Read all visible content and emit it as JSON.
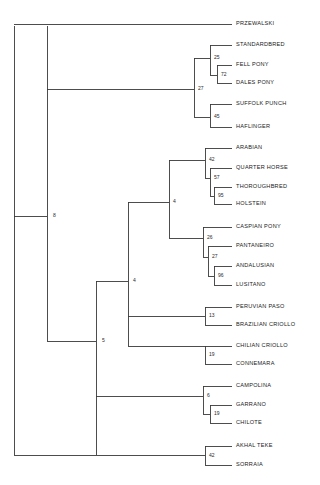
{
  "figure": {
    "name": "horse-breed-phylogenetic-tree",
    "type": "phylogram",
    "background_color": "#ffffff",
    "line_color": "#3a3a3a",
    "text_color": "#1a1a1a"
  },
  "chart_data": {
    "type": "tree",
    "title": "",
    "xlabel": "",
    "ylabel": "",
    "orientation": "left-to-right",
    "leaf_count": 22,
    "internal_node_count": 14,
    "taxa": [
      {
        "id": "t1",
        "label": "PRZEWALSKI",
        "x": 236,
        "y": 24
      },
      {
        "id": "t2",
        "label": "STANDARDBRED",
        "x": 236,
        "y": 45
      },
      {
        "id": "t3",
        "label": "FELL PONY",
        "x": 236,
        "y": 65
      },
      {
        "id": "t4",
        "label": "DALES PONY",
        "x": 236,
        "y": 83
      },
      {
        "id": "t5",
        "label": "SUFFOLK PUNCH",
        "x": 236,
        "y": 104
      },
      {
        "id": "t6",
        "label": "HAFLINGER",
        "x": 236,
        "y": 127
      },
      {
        "id": "t7",
        "label": "ARABIAN",
        "x": 236,
        "y": 148
      },
      {
        "id": "t8",
        "label": "QUARTER HORSE",
        "x": 236,
        "y": 168
      },
      {
        "id": "t9",
        "label": "THOROUGHBRED",
        "x": 236,
        "y": 187
      },
      {
        "id": "t10",
        "label": "HOLSTEIN",
        "x": 236,
        "y": 204
      },
      {
        "id": "t11",
        "label": "CASPIAN PONY",
        "x": 236,
        "y": 227
      },
      {
        "id": "t12",
        "label": "PANTANEIRO",
        "x": 236,
        "y": 246
      },
      {
        "id": "t13",
        "label": "ANDALUSIAN",
        "x": 236,
        "y": 266
      },
      {
        "id": "t14",
        "label": "LUSITANO",
        "x": 236,
        "y": 285
      },
      {
        "id": "t15",
        "label": "PERUVIAN PASO",
        "x": 236,
        "y": 307
      },
      {
        "id": "t16",
        "label": "BRAZILIAN CRIOLLO",
        "x": 236,
        "y": 325
      },
      {
        "id": "t17",
        "label": "CHILIAN CRIOLLO",
        "x": 236,
        "y": 346
      },
      {
        "id": "t18",
        "label": "CONNEMARA",
        "x": 236,
        "y": 364
      },
      {
        "id": "t19",
        "label": "CAMPOLINA",
        "x": 236,
        "y": 386
      },
      {
        "id": "t20",
        "label": "GARRANO",
        "x": 236,
        "y": 405
      },
      {
        "id": "t21",
        "label": "CHILOTE",
        "x": 236,
        "y": 423
      },
      {
        "id": "t22",
        "label": "AKHAL TEKE",
        "x": 236,
        "y": 446
      },
      {
        "id": "t23",
        "label": "SORRAIA",
        "x": 236,
        "y": 465
      }
    ],
    "support_values": [
      {
        "id": "n25",
        "label": "25",
        "x": 214,
        "y": 58,
        "node": "standardbred-fellpony-dalespony"
      },
      {
        "id": "n72",
        "label": "72",
        "x": 221,
        "y": 75,
        "node": "fellpony-dalespony"
      },
      {
        "id": "n27a",
        "label": "27",
        "x": 198,
        "y": 89,
        "node": "standardbred-group-plus-draft"
      },
      {
        "id": "n45",
        "label": "45",
        "x": 214,
        "y": 117,
        "node": "suffolkpunch-haflinger"
      },
      {
        "id": "n42a",
        "label": "42",
        "x": 209,
        "y": 160,
        "node": "arabian-quarterhorse-clade"
      },
      {
        "id": "n57",
        "label": "57",
        "x": 214,
        "y": 178,
        "node": "quarterhorse-thoroughbred-holstein"
      },
      {
        "id": "n95",
        "label": "95",
        "x": 218,
        "y": 196,
        "node": "thoroughbred-holstein"
      },
      {
        "id": "n26",
        "label": "26",
        "x": 207,
        "y": 238,
        "node": "caspianpony-iberian-clade"
      },
      {
        "id": "n27b",
        "label": "27",
        "x": 212,
        "y": 257,
        "node": "pantaneiro-andalusian-lusitano"
      },
      {
        "id": "n96",
        "label": "96",
        "x": 218,
        "y": 276,
        "node": "andalusian-lusitano"
      },
      {
        "id": "n13",
        "label": "13",
        "x": 209,
        "y": 316,
        "node": "peruvianpaso-braziliancriollo"
      },
      {
        "id": "n19a",
        "label": "19",
        "x": 209,
        "y": 355,
        "node": "chiliancriollo-connemara"
      },
      {
        "id": "n6",
        "label": "6",
        "x": 207,
        "y": 396,
        "node": "campolina-garrano-chilote"
      },
      {
        "id": "n19b",
        "label": "19",
        "x": 214,
        "y": 414,
        "node": "garrano-chilote"
      },
      {
        "id": "n42b",
        "label": "42",
        "x": 209,
        "y": 456,
        "node": "akhalteke-sorraia"
      },
      {
        "id": "n8",
        "label": "8",
        "x": 53,
        "y": 216,
        "node": "major-ingroup-node"
      },
      {
        "id": "n4a",
        "label": "4",
        "x": 173,
        "y": 202,
        "node": "arabian-caspian-clade"
      },
      {
        "id": "n4b",
        "label": "4",
        "x": 133,
        "y": 281,
        "node": "mid-clade-node"
      },
      {
        "id": "n5",
        "label": "5",
        "x": 102,
        "y": 341,
        "node": "lower-clade-node"
      }
    ],
    "branches": [
      {
        "name": "root-vertical",
        "d": "M 14 26 L 14 455"
      },
      {
        "name": "przewalski-branch",
        "d": "M 14 24 L 232 24"
      },
      {
        "name": "akhalteke-sorraia-root",
        "d": "M 14 455 L 205 455"
      },
      {
        "name": "node8-vertical",
        "d": "M 47 26 L 47 341"
      },
      {
        "name": "node8-stub",
        "d": "M 14 216 L 47 216"
      },
      {
        "name": "node27a-connector",
        "d": "M 47 89 L 194 89"
      },
      {
        "name": "node27a-vertical",
        "d": "M 194 58 L 194 117"
      },
      {
        "name": "node25-branch",
        "d": "M 194 58 L 210 58"
      },
      {
        "name": "node25-vertical",
        "d": "M 210 45 L 210 75"
      },
      {
        "name": "standardbred-branch",
        "d": "M 210 45 L 232 45"
      },
      {
        "name": "node72-branch",
        "d": "M 210 75 L 217 75"
      },
      {
        "name": "node72-vertical",
        "d": "M 217 65 L 217 83"
      },
      {
        "name": "fellpony-branch",
        "d": "M 217 65 L 232 65"
      },
      {
        "name": "dalespony-branch",
        "d": "M 217 83 L 232 83"
      },
      {
        "name": "node45-branch",
        "d": "M 194 117 L 210 117"
      },
      {
        "name": "node45-vertical",
        "d": "M 210 104 L 210 127"
      },
      {
        "name": "suffolkpunch-branch",
        "d": "M 210 104 L 232 104"
      },
      {
        "name": "haflinger-branch",
        "d": "M 210 127 L 232 127"
      },
      {
        "name": "node5-vertical",
        "d": "M 96 281 L 96 455"
      },
      {
        "name": "node5-stub",
        "d": "M 47 341 L 96 341"
      },
      {
        "name": "node4b-connector",
        "d": "M 96 281 L 128 281"
      },
      {
        "name": "node4b-vertical",
        "d": "M 128 202 L 128 346"
      },
      {
        "name": "node4a-connector",
        "d": "M 128 202 L 169 202"
      },
      {
        "name": "node4a-vertical",
        "d": "M 169 160 L 169 238"
      },
      {
        "name": "node42a-branch",
        "d": "M 169 160 L 205 160"
      },
      {
        "name": "node42a-vertical",
        "d": "M 205 148 L 205 178"
      },
      {
        "name": "arabian-branch",
        "d": "M 205 148 L 232 148"
      },
      {
        "name": "node57-branch",
        "d": "M 205 178 L 210 178"
      },
      {
        "name": "node57-vertical",
        "d": "M 210 168 L 210 196"
      },
      {
        "name": "quarterhorse-branch",
        "d": "M 210 168 L 232 168"
      },
      {
        "name": "node95-branch",
        "d": "M 210 196 L 214 196"
      },
      {
        "name": "node95-vertical",
        "d": "M 214 187 L 214 204"
      },
      {
        "name": "thoroughbred-branch",
        "d": "M 214 187 L 232 187"
      },
      {
        "name": "holstein-branch",
        "d": "M 214 204 L 232 204"
      },
      {
        "name": "node26-branch",
        "d": "M 169 238 L 203 238"
      },
      {
        "name": "node26-vertical",
        "d": "M 203 227 L 203 257"
      },
      {
        "name": "caspianpony-branch",
        "d": "M 203 227 L 232 227"
      },
      {
        "name": "node27b-branch",
        "d": "M 203 257 L 208 257"
      },
      {
        "name": "node27b-vertical",
        "d": "M 208 246 L 208 276"
      },
      {
        "name": "pantaneiro-branch",
        "d": "M 208 246 L 232 246"
      },
      {
        "name": "node96-branch",
        "d": "M 208 276 L 214 276"
      },
      {
        "name": "node96-vertical",
        "d": "M 214 266 L 214 285"
      },
      {
        "name": "andalusian-branch",
        "d": "M 214 266 L 232 266"
      },
      {
        "name": "lusitano-branch",
        "d": "M 214 285 L 232 285"
      },
      {
        "name": "node13-connector",
        "d": "M 128 316 L 205 316"
      },
      {
        "name": "node13-vertical",
        "d": "M 205 307 L 205 325"
      },
      {
        "name": "peruvianpaso-branch",
        "d": "M 205 307 L 232 307"
      },
      {
        "name": "braziliancriollo-branch",
        "d": "M 205 325 L 232 325"
      },
      {
        "name": "node19a-connector",
        "d": "M 128 346 L 205 346"
      },
      {
        "name": "node19a-vertical",
        "d": "M 205 346 L 205 364"
      },
      {
        "name": "chiliancriollo-branch",
        "d": "M 205 346 L 232 346"
      },
      {
        "name": "connemara-branch",
        "d": "M 205 364 L 232 364"
      },
      {
        "name": "node6-connector",
        "d": "M 96 396 L 203 396"
      },
      {
        "name": "node6-vertical",
        "d": "M 203 386 L 203 414"
      },
      {
        "name": "campolina-branch",
        "d": "M 203 386 L 232 386"
      },
      {
        "name": "node19b-branch",
        "d": "M 203 414 L 210 414"
      },
      {
        "name": "node19b-vertical",
        "d": "M 210 405 L 210 423"
      },
      {
        "name": "garrano-branch",
        "d": "M 210 405 L 232 405"
      },
      {
        "name": "chilote-branch",
        "d": "M 210 423 L 232 423"
      },
      {
        "name": "node42b-vertical",
        "d": "M 205 446 L 205 465"
      },
      {
        "name": "akhalteke-branch",
        "d": "M 205 446 L 232 446"
      },
      {
        "name": "sorraia-branch",
        "d": "M 205 465 L 232 465"
      }
    ]
  }
}
